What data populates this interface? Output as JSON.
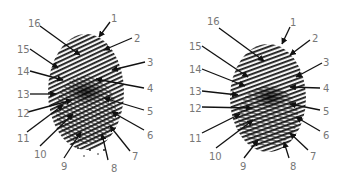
{
  "figure": {
    "type": "annotated fingerprint diagram",
    "panels": [
      {
        "id": "left",
        "labels": [
          {
            "n": "1",
            "x": 111,
            "y": 14,
            "tip": [
              99,
              37
            ],
            "tail": [
              110,
              22
            ]
          },
          {
            "n": "2",
            "x": 134,
            "y": 34,
            "tip": [
              104,
              50
            ],
            "tail": [
              132,
              38
            ]
          },
          {
            "n": "3",
            "x": 147,
            "y": 58,
            "tip": [
              112,
              70
            ],
            "tail": [
              145,
              62
            ]
          },
          {
            "n": "4",
            "x": 147,
            "y": 84,
            "tip": [
              96,
              79
            ],
            "tail": [
              144,
              88
            ]
          },
          {
            "n": "5",
            "x": 147,
            "y": 107,
            "tip": [
              104,
              98
            ],
            "tail": [
              144,
              110
            ]
          },
          {
            "n": "6",
            "x": 147,
            "y": 131,
            "tip": [
              112,
              112
            ],
            "tail": [
              144,
              130
            ]
          },
          {
            "n": "7",
            "x": 132,
            "y": 152,
            "tip": [
              110,
              126
            ],
            "tail": [
              130,
              151
            ]
          },
          {
            "n": "8",
            "x": 111,
            "y": 164,
            "tip": [
              102,
              134
            ],
            "tail": [
              108,
              160
            ]
          },
          {
            "n": "9",
            "x": 61,
            "y": 162,
            "tip": [
              81,
              132
            ],
            "tail": [
              64,
              158
            ]
          },
          {
            "n": "10",
            "x": 34,
            "y": 150,
            "tip": [
              73,
              114
            ],
            "tail": [
              40,
              146
            ]
          },
          {
            "n": "11",
            "x": 17,
            "y": 134,
            "tip": [
              63,
              105
            ],
            "tail": [
              27,
              132
            ]
          },
          {
            "n": "12",
            "x": 17,
            "y": 109,
            "tip": [
              72,
              100
            ],
            "tail": [
              28,
              112
            ]
          },
          {
            "n": "13",
            "x": 17,
            "y": 90,
            "tip": [
              56,
              94
            ],
            "tail": [
              30,
              94
            ]
          },
          {
            "n": "14",
            "x": 17,
            "y": 67,
            "tip": [
              63,
              80
            ],
            "tail": [
              30,
              71
            ]
          },
          {
            "n": "15",
            "x": 17,
            "y": 45,
            "tip": [
              58,
              68
            ],
            "tail": [
              30,
              49
            ]
          },
          {
            "n": "16",
            "x": 28,
            "y": 19,
            "tip": [
              80,
              55
            ],
            "tail": [
              40,
              26
            ]
          }
        ]
      },
      {
        "id": "right",
        "labels": [
          {
            "n": "1",
            "x": 118,
            "y": 18,
            "tip": [
              110,
              44
            ],
            "tail": [
              118,
              27
            ]
          },
          {
            "n": "2",
            "x": 140,
            "y": 34,
            "tip": [
              118,
              55
            ],
            "tail": [
              138,
              40
            ]
          },
          {
            "n": "3",
            "x": 151,
            "y": 58,
            "tip": [
              124,
              77
            ],
            "tail": [
              150,
              63
            ]
          },
          {
            "n": "4",
            "x": 151,
            "y": 84,
            "tip": [
              118,
              87
            ],
            "tail": [
              148,
              88
            ]
          },
          {
            "n": "5",
            "x": 151,
            "y": 107,
            "tip": [
              118,
              104
            ],
            "tail": [
              148,
              110
            ]
          },
          {
            "n": "6",
            "x": 151,
            "y": 131,
            "tip": [
              124,
              117
            ],
            "tail": [
              148,
              131
            ]
          },
          {
            "n": "7",
            "x": 138,
            "y": 152,
            "tip": [
              118,
              133
            ],
            "tail": [
              136,
              150
            ]
          },
          {
            "n": "8",
            "x": 118,
            "y": 162,
            "tip": [
              112,
              142
            ],
            "tail": [
              117,
              158
            ]
          },
          {
            "n": "9",
            "x": 68,
            "y": 162,
            "tip": [
              86,
              140
            ],
            "tail": [
              72,
              158
            ]
          },
          {
            "n": "10",
            "x": 37,
            "y": 152,
            "tip": [
              81,
              120
            ],
            "tail": [
              44,
              148
            ]
          },
          {
            "n": "11",
            "x": 17,
            "y": 134,
            "tip": [
              68,
              114
            ],
            "tail": [
              30,
              133
            ]
          },
          {
            "n": "12",
            "x": 17,
            "y": 104,
            "tip": [
              80,
              108
            ],
            "tail": [
              30,
              107
            ]
          },
          {
            "n": "13",
            "x": 17,
            "y": 87,
            "tip": [
              66,
              95
            ],
            "tail": [
              30,
              91
            ]
          },
          {
            "n": "14",
            "x": 17,
            "y": 65,
            "tip": [
              73,
              86
            ],
            "tail": [
              30,
              69
            ]
          },
          {
            "n": "15",
            "x": 17,
            "y": 42,
            "tip": [
              76,
              77
            ],
            "tail": [
              30,
              46
            ]
          },
          {
            "n": "16",
            "x": 35,
            "y": 17,
            "tip": [
              92,
              61
            ],
            "tail": [
              47,
              28
            ]
          }
        ]
      }
    ]
  },
  "colors": {
    "label": "#777777",
    "arrow": "#111111",
    "ridges": "#1a1a1a",
    "background": "#ffffff"
  }
}
